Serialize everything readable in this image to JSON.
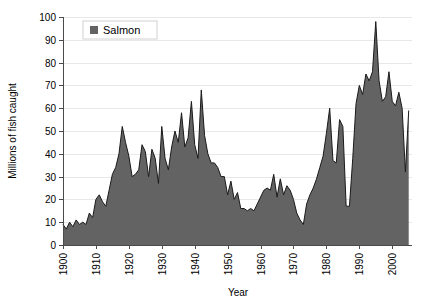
{
  "chart_data": {
    "type": "area",
    "title": "",
    "xlabel": "Year",
    "ylabel": "Millions of fish caught",
    "xlim": [
      1900,
      2006
    ],
    "ylim": [
      0,
      100
    ],
    "ytick_step": 10,
    "xtick_step": 10,
    "grid": true,
    "legend_position": "top-left-inside",
    "series": [
      {
        "name": "Salmon",
        "color": "#636363",
        "line_color": "#1a1a1a",
        "x": [
          1900,
          1901,
          1902,
          1903,
          1904,
          1905,
          1906,
          1907,
          1908,
          1909,
          1910,
          1911,
          1912,
          1913,
          1914,
          1915,
          1916,
          1917,
          1918,
          1919,
          1920,
          1921,
          1922,
          1923,
          1924,
          1925,
          1926,
          1927,
          1928,
          1929,
          1930,
          1931,
          1932,
          1933,
          1934,
          1935,
          1936,
          1937,
          1938,
          1939,
          1940,
          1941,
          1942,
          1943,
          1944,
          1945,
          1946,
          1947,
          1948,
          1949,
          1950,
          1951,
          1952,
          1953,
          1954,
          1955,
          1956,
          1957,
          1958,
          1959,
          1960,
          1961,
          1962,
          1963,
          1964,
          1965,
          1966,
          1967,
          1968,
          1969,
          1970,
          1971,
          1972,
          1973,
          1974,
          1975,
          1976,
          1977,
          1978,
          1979,
          1980,
          1981,
          1982,
          1983,
          1984,
          1985,
          1986,
          1987,
          1988,
          1989,
          1990,
          1991,
          1992,
          1993,
          1994,
          1995,
          1996,
          1997,
          1998,
          1999,
          2000,
          2001,
          2002,
          2003,
          2004,
          2005
        ],
        "values": [
          9,
          7,
          10,
          8,
          11,
          9,
          10,
          9,
          14,
          12,
          20,
          22,
          19,
          17,
          24,
          31,
          34,
          40,
          52,
          45,
          39,
          30,
          31,
          33,
          44,
          41,
          30,
          42,
          38,
          27,
          52,
          38,
          33,
          43,
          50,
          45,
          58,
          43,
          47,
          63,
          44,
          38,
          68,
          48,
          40,
          36,
          36,
          34,
          30,
          30,
          22,
          28,
          20,
          23,
          16,
          16,
          15,
          16,
          15,
          18,
          21,
          24,
          25,
          24,
          31,
          21,
          29,
          22,
          26,
          24,
          20,
          14,
          11,
          9,
          18,
          22,
          25,
          29,
          34,
          39,
          49,
          60,
          37,
          36,
          55,
          52,
          17,
          17,
          38,
          62,
          70,
          66,
          75,
          72,
          76,
          98,
          72,
          63,
          65,
          76,
          63,
          61,
          67,
          60,
          32,
          59
        ]
      }
    ],
    "ytick_labels": [
      "0",
      "10",
      "20",
      "30",
      "40",
      "50",
      "60",
      "70",
      "80",
      "90",
      "100"
    ],
    "xtick_labels": [
      "1900",
      "1910",
      "1920",
      "1930",
      "1940",
      "1950",
      "1960",
      "1970",
      "1980",
      "1990",
      "2000"
    ]
  },
  "legend": {
    "entries": [
      {
        "label": "Salmon",
        "swatch_color": "#636363"
      }
    ]
  },
  "axes": {
    "y_title": "Millions of fish caught",
    "x_title": "Year"
  }
}
